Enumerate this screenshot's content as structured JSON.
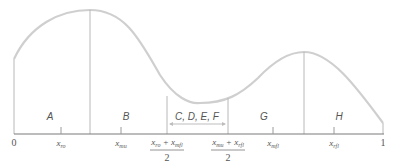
{
  "diagram": {
    "type": "piecewise-region-curve",
    "colors": {
      "curve": "#cfcfcf",
      "axis": "#7a7a7a",
      "text": "#555555"
    },
    "axis": {
      "start_label": "0",
      "end_label": "1"
    },
    "regions": [
      {
        "id": "A",
        "label": "A"
      },
      {
        "id": "B",
        "label": "B"
      },
      {
        "id": "CDEF",
        "label": "C, D, E, F"
      },
      {
        "id": "G",
        "label": "G"
      },
      {
        "id": "H",
        "label": "H"
      }
    ],
    "ticks": [
      {
        "var": "x",
        "sub": "ro"
      },
      {
        "var": "x",
        "sub": "mu"
      },
      {
        "var": "x",
        "sub": "mfl"
      },
      {
        "var": "x",
        "sub": "rfl"
      }
    ],
    "fractions": [
      {
        "num_a_var": "x",
        "num_a_sub": "ro",
        "op": "+",
        "num_b_var": "x",
        "num_b_sub": "mfl",
        "den": "2"
      },
      {
        "num_a_var": "x",
        "num_a_sub": "mu",
        "op": "+",
        "num_b_var": "x",
        "num_b_sub": "rfl",
        "den": "2"
      }
    ]
  }
}
